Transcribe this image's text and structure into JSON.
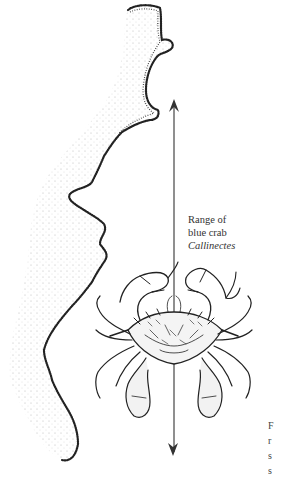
{
  "figure": {
    "label": {
      "line1": "Range of",
      "line2": "blue crab",
      "genus": "Callinectes"
    },
    "cut_off_caption": [
      "F",
      "r",
      "s",
      "s"
    ],
    "range_arrow": {
      "top_y": 100,
      "bottom_y": 455,
      "x": 174,
      "color": "#333333"
    },
    "coastline": {
      "fill": "#ffffff",
      "stipple_color": "#222222"
    },
    "crab": {
      "subject": "blue crab (Callinectes) illustration",
      "ink_color": "#222222"
    }
  }
}
